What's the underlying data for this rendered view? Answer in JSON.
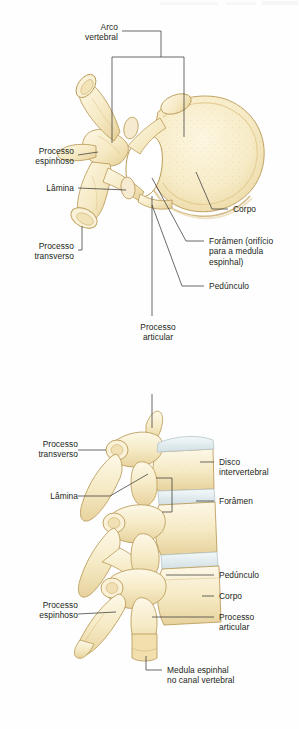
{
  "figure": {
    "title_absent": true,
    "language": "pt-BR",
    "background_color": "#fefefe",
    "bone_color": "#f7ecc8",
    "bone_shade_color": "#e8d49a",
    "bone_outline_color": "#b99a57",
    "disc_color": "#e6eef0",
    "disc_outline_color": "#b8c6c9",
    "text_color": "#231f20",
    "leader_color": "#3a3a3a"
  },
  "panels": [
    {
      "id": "superior-view",
      "name": "vista-superior-vertebra",
      "labels": [
        {
          "id": "arco-vertebral",
          "text": "Arco\nvertebral",
          "align": "right",
          "x": 118,
          "y": 26
        },
        {
          "id": "processo-espinhoso-sup",
          "text": "Processo\nespinhoso",
          "align": "right",
          "x": 74,
          "y": 145
        },
        {
          "id": "lamina-sup",
          "text": "Lâmina",
          "align": "right",
          "x": 74,
          "y": 184
        },
        {
          "id": "processo-transverso-sup",
          "text": "Processo\ntransverso",
          "align": "right",
          "x": 74,
          "y": 245
        },
        {
          "id": "corpo-sup",
          "text": "Corpo",
          "align": "left",
          "x": 233,
          "y": 205
        },
        {
          "id": "foramen-sup",
          "text": "Forâmen (orifício\npara a medula\nespinhal)",
          "align": "left",
          "x": 208,
          "y": 237
        },
        {
          "id": "pedunculo-sup",
          "text": "Pedúnculo",
          "align": "left",
          "x": 208,
          "y": 282
        },
        {
          "id": "processo-articular-sup",
          "text": "Processo\narticular",
          "align": "center",
          "x": 158,
          "y": 324
        }
      ]
    },
    {
      "id": "lateral-view",
      "name": "vista-lateral-coluna",
      "labels": [
        {
          "id": "processo-transverso-lat",
          "text": "Processo\ntransverso",
          "align": "right",
          "x": 74,
          "y": 443
        },
        {
          "id": "lamina-lat",
          "text": "Lâmina",
          "align": "right",
          "x": 74,
          "y": 492
        },
        {
          "id": "disco-intervertebral",
          "text": "Disco\nintervertebral",
          "align": "left",
          "x": 218,
          "y": 458
        },
        {
          "id": "foramen-lat",
          "text": "Forâmen",
          "align": "left",
          "x": 218,
          "y": 497
        },
        {
          "id": "pedunculo-lat",
          "text": "Pedúnculo",
          "align": "left",
          "x": 218,
          "y": 571
        },
        {
          "id": "corpo-lat",
          "text": "Corpo",
          "align": "left",
          "x": 218,
          "y": 592
        },
        {
          "id": "processo-espinhoso-lat",
          "text": "Processo\nespinhoso",
          "align": "right",
          "x": 74,
          "y": 604
        },
        {
          "id": "processo-articular-lat",
          "text": "Processo\narticular",
          "align": "left",
          "x": 218,
          "y": 613
        },
        {
          "id": "medula-espinhal",
          "text": "Medula espinhal\nno canal vertebral",
          "align": "left",
          "x": 166,
          "y": 666
        }
      ]
    }
  ]
}
